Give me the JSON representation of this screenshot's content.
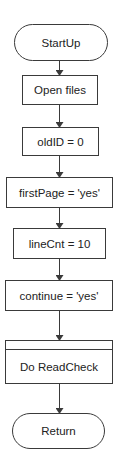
{
  "diagram": {
    "type": "flowchart",
    "colors": {
      "stroke": "#3a3a3a",
      "text": "#222222",
      "fill": "#ffffff",
      "background": "#ffffff"
    },
    "nodes": [
      {
        "id": "startup",
        "shape": "terminator",
        "label": "StartUp",
        "x": 14,
        "y": 24,
        "w": 93,
        "h": 36
      },
      {
        "id": "open-files",
        "shape": "process",
        "label": "Open files",
        "x": 22,
        "y": 75,
        "w": 75,
        "h": 29
      },
      {
        "id": "old-id",
        "shape": "process",
        "label": "oldID = 0",
        "x": 22,
        "y": 127,
        "w": 76,
        "h": 28
      },
      {
        "id": "first-page",
        "shape": "process",
        "label": "firstPage = 'yes'",
        "x": 6,
        "y": 177,
        "w": 106,
        "h": 30
      },
      {
        "id": "line-cnt",
        "shape": "process",
        "label": "lineCnt = 10",
        "x": 13,
        "y": 228,
        "w": 92,
        "h": 30
      },
      {
        "id": "continue",
        "shape": "process",
        "label": "continue = 'yes'",
        "x": 5,
        "y": 280,
        "w": 107,
        "h": 30
      },
      {
        "id": "do-readcheck",
        "shape": "predefined-process",
        "label": "Do ReadCheck",
        "x": 5,
        "y": 340,
        "w": 107,
        "h": 43
      },
      {
        "id": "return",
        "shape": "terminator",
        "label": "Return",
        "x": 12,
        "y": 413,
        "w": 92,
        "h": 35
      }
    ],
    "edges": [
      {
        "from": "startup",
        "to": "open-files"
      },
      {
        "from": "open-files",
        "to": "old-id"
      },
      {
        "from": "old-id",
        "to": "first-page"
      },
      {
        "from": "first-page",
        "to": "line-cnt"
      },
      {
        "from": "line-cnt",
        "to": "continue"
      },
      {
        "from": "continue",
        "to": "do-readcheck"
      },
      {
        "from": "do-readcheck",
        "to": "return"
      }
    ]
  }
}
